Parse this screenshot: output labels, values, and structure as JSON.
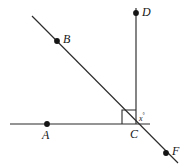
{
  "figure": {
    "canvas": {
      "width": 188,
      "height": 168,
      "background": "#ffffff"
    },
    "stroke_color": "#2b2b2b",
    "dot_color": "#151515",
    "label_color": "#161616",
    "points": [
      {
        "id": "A",
        "label": "A",
        "x": 47,
        "y": 124,
        "label_x": 42,
        "label_y": 129,
        "on": "ray-CA"
      },
      {
        "id": "B",
        "label": "B",
        "x": 57,
        "y": 41,
        "label_x": 63,
        "label_y": 33,
        "on": "line-BF"
      },
      {
        "id": "C",
        "label": "C",
        "x": 136,
        "y": 124,
        "label_x": 130,
        "label_y": 128,
        "on": "intersection"
      },
      {
        "id": "D",
        "label": "D",
        "x": 136,
        "y": 13,
        "label_x": 142,
        "label_y": 6,
        "on": "ray-CD"
      },
      {
        "id": "F",
        "label": "F",
        "x": 166,
        "y": 153,
        "label_x": 172,
        "label_y": 145,
        "on": "line-BF"
      }
    ],
    "segments": [
      {
        "id": "horizontal-AC",
        "name": "horizontal-line",
        "x1": 10,
        "y1": 124,
        "x2": 150,
        "y2": 124
      },
      {
        "id": "vertical-CD",
        "name": "vertical-line",
        "x1": 136,
        "y1": 8,
        "x2": 136,
        "y2": 124
      },
      {
        "id": "diagonal-BF",
        "name": "diagonal-line",
        "x1": 32,
        "y1": 16,
        "x2": 178,
        "y2": 163
      }
    ],
    "right_angle": {
      "name": "right-angle-marker",
      "vertex_x": 136,
      "vertex_y": 124,
      "size": 14,
      "measure": "90"
    },
    "angle_label": {
      "name": "angle-x",
      "text": "x",
      "degree_symbol": "°",
      "x": 139,
      "y": 113
    }
  }
}
